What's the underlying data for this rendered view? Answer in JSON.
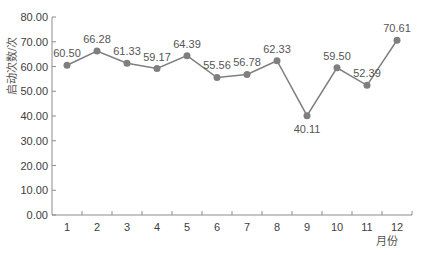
{
  "chart_data": {
    "type": "line",
    "title": "",
    "xlabel": "月份",
    "ylabel": "启动次数/次",
    "categories": [
      "1",
      "2",
      "3",
      "4",
      "5",
      "6",
      "7",
      "8",
      "9",
      "10",
      "11",
      "12"
    ],
    "values": [
      60.5,
      66.28,
      61.33,
      59.17,
      64.39,
      55.56,
      56.78,
      62.33,
      40.11,
      59.5,
      52.39,
      70.61
    ],
    "data_labels": [
      "60.50",
      "66.28",
      "61.33",
      "59.17",
      "64.39",
      "55.56",
      "56.78",
      "62.33",
      "40.11",
      "59.50",
      "52.39",
      "70.61"
    ],
    "label_positions": [
      "above",
      "above",
      "above",
      "above",
      "above",
      "above",
      "above",
      "above",
      "below",
      "above",
      "above",
      "above"
    ],
    "ylim": [
      0,
      80
    ],
    "yticks": [
      "0.00",
      "10.00",
      "20.00",
      "30.00",
      "40.00",
      "50.00",
      "60.00",
      "70.00",
      "80.00"
    ],
    "grid": false,
    "legend": null,
    "colors": {
      "line": "#7f7f7f",
      "marker": "#7f7f7f",
      "axis": "#8c8c8c",
      "text": "#404040"
    }
  }
}
